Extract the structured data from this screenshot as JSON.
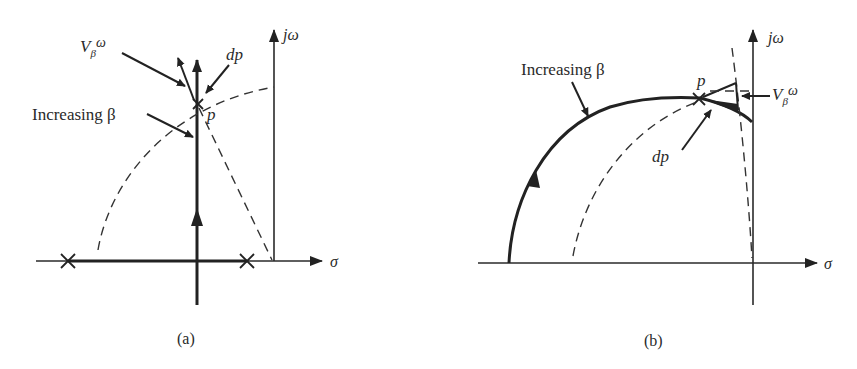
{
  "figure": {
    "panels": [
      {
        "id": "a",
        "caption": "(a)",
        "axes": {
          "real_label": "σ",
          "imag_label": "jω"
        },
        "labels": {
          "velocity": "V",
          "velocity_sub": "β",
          "velocity_sup": "ω",
          "dp": "dp",
          "point": "p",
          "increasing": "Increasing β"
        },
        "poles": 2,
        "description": "Root locus on real axis between two poles, breaking away vertically through point p; dashed circular arc and dashed line shown"
      },
      {
        "id": "b",
        "caption": "(b)",
        "axes": {
          "real_label": "σ",
          "imag_label": "jω"
        },
        "labels": {
          "velocity": "V",
          "velocity_sub": "β",
          "velocity_sup": "ω",
          "dp": "dp",
          "point": "p",
          "increasing": "Increasing β"
        },
        "description": "Curved root locus arc rising from negative real axis to point p near the imaginary axis; dashed arcs shown"
      }
    ]
  }
}
